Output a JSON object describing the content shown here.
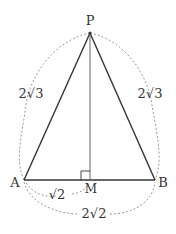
{
  "figure": {
    "points": {
      "P": {
        "label": "P",
        "x": 90,
        "y": 33
      },
      "A": {
        "label": "A",
        "x": 24,
        "y": 180
      },
      "B": {
        "label": "B",
        "x": 155,
        "y": 180
      },
      "M": {
        "label": "M",
        "x": 90,
        "y": 180
      }
    },
    "lengths": {
      "PA": "2√3",
      "PB": "2√3",
      "AM": "√2",
      "AB": "2√2"
    },
    "right_angle_at": "M",
    "colors": {
      "line": "#333333",
      "dashed": "#999999",
      "text": "#333333"
    }
  }
}
